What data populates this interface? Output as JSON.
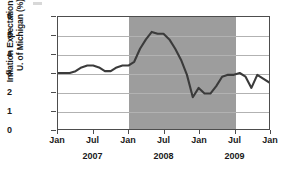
{
  "axis": {
    "ylabel_line1": "Inflation Expectations—",
    "ylabel_line2": "U. of Michigan (%)",
    "yticks": [
      "6",
      "5",
      "4",
      "3",
      "2",
      "1",
      "0"
    ],
    "xticks": [
      "Jan",
      "Jul",
      "Jan",
      "Jul",
      "Jan",
      "Jul",
      "Jan"
    ],
    "years": [
      "2007",
      "2008",
      "2009"
    ]
  },
  "colors": {
    "line": "#3b3b3b",
    "recession_band": "#9d9d9d",
    "gridline": "#b2b2b2",
    "frame": "#4d4d4d",
    "background": "#ffffff"
  },
  "chart_data": {
    "type": "line",
    "title": "",
    "xlabel": "",
    "ylabel": "Inflation Expectations—U. of Michigan (%)",
    "ylim": [
      0,
      6
    ],
    "ytick_values": [
      0,
      1,
      2,
      3,
      4,
      5,
      6
    ],
    "grid": true,
    "legend": "none",
    "xlim": [
      "2007-01",
      "2010-01"
    ],
    "xtick_labels": [
      "Jan",
      "Jul",
      "Jan",
      "Jul",
      "Jan",
      "Jul",
      "Jan"
    ],
    "xtick_x": [
      "2007-01",
      "2007-07",
      "2008-01",
      "2008-07",
      "2009-01",
      "2009-07",
      "2010-01"
    ],
    "year_group_labels": [
      "2007",
      "2008",
      "2009"
    ],
    "shaded_regions": [
      {
        "label": "recession",
        "start": "2008-01",
        "end": "2009-06",
        "color": "#9d9d9d"
      }
    ],
    "series": [
      {
        "name": "Inflation Expectations — U. of Michigan (%)",
        "color": "#3b3b3b",
        "x": [
          "2007-01",
          "2007-02",
          "2007-03",
          "2007-04",
          "2007-05",
          "2007-06",
          "2007-07",
          "2007-08",
          "2007-09",
          "2007-10",
          "2007-11",
          "2007-12",
          "2008-01",
          "2008-02",
          "2008-03",
          "2008-04",
          "2008-05",
          "2008-06",
          "2008-07",
          "2008-08",
          "2008-09",
          "2008-10",
          "2008-11",
          "2008-12",
          "2009-01",
          "2009-02",
          "2009-03",
          "2009-04",
          "2009-05",
          "2009-06",
          "2009-07",
          "2009-08",
          "2009-09",
          "2009-10",
          "2009-11",
          "2009-12",
          "2010-01"
        ],
        "values": [
          3.0,
          3.0,
          3.0,
          3.1,
          3.3,
          3.4,
          3.4,
          3.3,
          3.1,
          3.1,
          3.3,
          3.4,
          3.4,
          3.6,
          4.3,
          4.8,
          5.2,
          5.1,
          5.1,
          4.8,
          4.3,
          3.7,
          2.9,
          1.7,
          2.2,
          1.9,
          1.9,
          2.3,
          2.8,
          2.9,
          2.9,
          3.0,
          2.8,
          2.2,
          2.9,
          2.7,
          2.5
        ]
      }
    ]
  }
}
